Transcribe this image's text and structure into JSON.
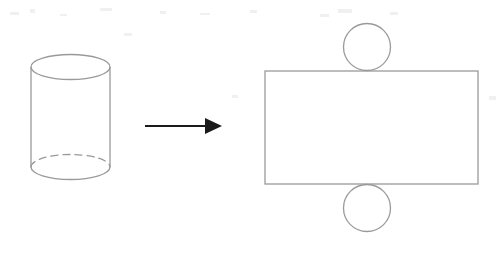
{
  "figure": {
    "background_color": "#ffffff",
    "stroke_color": "#9a9a9a",
    "arrow_color": "#1a1a1a",
    "width": 504,
    "height": 254
  },
  "solid": {
    "name": "cylinder",
    "label": "Cylinder",
    "center_x": 70.5,
    "left_x": 31,
    "right_x": 110,
    "radius_x": 39.5,
    "radius_y": 12.5,
    "top_center_y": 67,
    "bottom_center_y": 167,
    "top_ellipse_top_y": 55,
    "bottom_ellipse_bottom_y": 179,
    "hidden_edge_style": "dashed",
    "visible_edge_style": "solid"
  },
  "arrow": {
    "name": "transformation-arrow",
    "label": "becomes",
    "direction": "right",
    "start_x": 145,
    "end_x": 222,
    "y": 126,
    "shaft_width": 2.2,
    "head_length": 17,
    "head_width": 16,
    "color": "#1a1a1a"
  },
  "net": {
    "name": "cylinder-net",
    "label": "Net of cylinder",
    "rectangle": {
      "name": "lateral-surface-rectangle",
      "label": "Lateral surface",
      "x": 265,
      "y": 71,
      "width": 213,
      "height": 113
    },
    "top_circle": {
      "name": "top-base-circle",
      "label": "Top base",
      "cx": 367,
      "cy": 47,
      "r": 23.5
    },
    "bottom_circle": {
      "name": "bottom-base-circle",
      "label": "Bottom base",
      "cx": 367,
      "cy": 208,
      "r": 23.5
    }
  },
  "scan_artifacts": [
    {
      "x": 10,
      "y": 12,
      "w": 9,
      "h": 3
    },
    {
      "x": 30,
      "y": 9,
      "w": 5,
      "h": 4
    },
    {
      "x": 60,
      "y": 14,
      "w": 7,
      "h": 2
    },
    {
      "x": 100,
      "y": 8,
      "w": 12,
      "h": 3
    },
    {
      "x": 124,
      "y": 33,
      "w": 8,
      "h": 3
    },
    {
      "x": 160,
      "y": 11,
      "w": 6,
      "h": 3
    },
    {
      "x": 200,
      "y": 13,
      "w": 10,
      "h": 2
    },
    {
      "x": 250,
      "y": 10,
      "w": 7,
      "h": 3
    },
    {
      "x": 320,
      "y": 14,
      "w": 9,
      "h": 3
    },
    {
      "x": 338,
      "y": 9,
      "w": 14,
      "h": 4
    },
    {
      "x": 390,
      "y": 12,
      "w": 8,
      "h": 3
    },
    {
      "x": 232,
      "y": 95,
      "w": 6,
      "h": 3
    },
    {
      "x": 489,
      "y": 96,
      "w": 7,
      "h": 4
    }
  ]
}
